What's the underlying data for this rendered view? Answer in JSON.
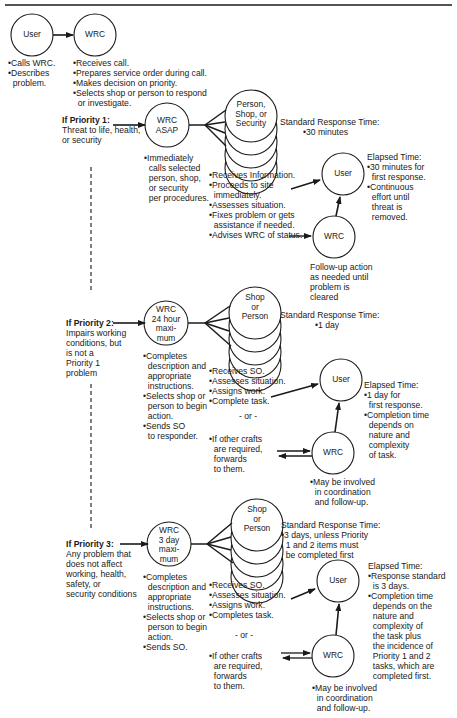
{
  "intake": {
    "user_node": "User",
    "wrc_node": "WRC",
    "user_notes": "•Calls WRC.\n•Describes\n  problem.",
    "wrc_notes": "•Receives call.\n•Prepares service order during call.\n•Makes decision on priority.\n•Selects shop or person to respond\n  or investigate."
  },
  "priorities": [
    {
      "title": "If Priority 1:",
      "description": "Threat to life, health,\nor security",
      "wrc_node": "WRC\nASAP",
      "wrc_notes": "•Immediately\n  calls selected\n  person, shop,\n  or security\n  per procedures.",
      "responder_node": "Person,\nShop, or\nSecurity",
      "standard_response_label": "Standard Response Time:",
      "standard_response_value": "•30 minutes",
      "responder_notes": "•Receives Information.\n•Proceeds to site\n  immediately.\n•Assesses situation.\n•Fixes problem or gets\n  assistance if needed.\n•Advises WRC of status.",
      "user_node": "User",
      "followup_wrc_node": "WRC",
      "elapsed_time": "Elapsed Time:\n•30 minutes for\n  first response.\n•Continuous\n  effort until\n  threat is\n  removed.",
      "followup_notes": "Follow-up action\nas needed until\nproblem is\ncleared"
    },
    {
      "title": "If Priority 2:",
      "description": "Impairs working\nconditions, but\nis not a\nPriority 1\nproblem",
      "wrc_node": "WRC\n24 hour\nmaxi-\nmum",
      "wrc_notes": "•Completes\n  description and\n  appropriate\n  instructions.\n•Selects shop or\n  person to begin\n  action.\n•Sends SO\n  to responder.",
      "responder_node": "Shop\nor\nPerson",
      "standard_response_label": "Standard Response Time:",
      "standard_response_value": "•1 day",
      "responder_notes": "•Receives SO.\n•Assesses situation.\n•Assigns work.\n•Complete task.",
      "or_label": "- or -",
      "other_crafts": "•If other crafts\n  are required,\n  forwards\n  to them.",
      "user_node": "User",
      "followup_wrc_node": "WRC",
      "elapsed_time": "Elapsed Time:\n•1 day for\n  first response.\n•Completion time\n  depends on\n  nature and\n  complexity\n  of task.",
      "followup_notes": "•May be involved\n  in coordination\n  and follow-up."
    },
    {
      "title": "If Priority 3:",
      "description": "Any problem that\ndoes not affect\nworking, health,\nsafety, or\nsecurity conditions",
      "wrc_node": "WRC\n3 day\nmaxi-\nmum",
      "wrc_notes": "•Completes\n  description and\n  appropriate\n  instructions.\n•Selects shop or\n  person to begin\n  action.\n•Sends SO.",
      "responder_node": "Shop\nor\nPerson",
      "standard_response_label": "Standard Response Time:",
      "standard_response_value": "•3 days, unless Priority\n  1 and 2 items must\n  be completed first",
      "responder_notes": "•Receives SO.\n•Assesses situation.\n•Assigns work.\n•Completes task.",
      "or_label": "- or -",
      "other_crafts": "•If other crafts\n  are required,\n  forwards\n  to them.",
      "user_node": "User",
      "followup_wrc_node": "WRC",
      "elapsed_time": "Elapsed Time:\n•Response standard\n  is 3 days.\n•Completion time\n  depends on the\n  nature and\n  complexity of\n  the task plus\n  the incidence of\n  Priority 1 and 2\n  tasks, which are\n  completed first.",
      "followup_notes": "•May be involved\n  in coordination\n  and follow-up."
    }
  ],
  "colors": {
    "ink": "#1a1a1a",
    "background": "#ffffff"
  }
}
